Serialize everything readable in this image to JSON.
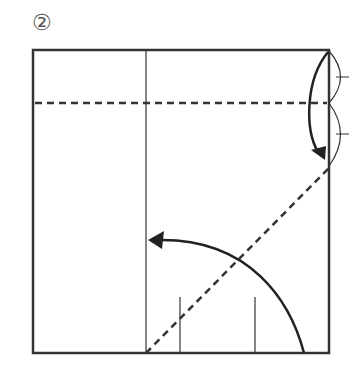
{
  "step": {
    "label": "②",
    "number": 2
  },
  "diagram": {
    "type": "origami-fold-step",
    "colors": {
      "line": "#333333",
      "background": "#ffffff"
    },
    "square": {
      "x": 33,
      "y": 50,
      "w": 296,
      "h": 303
    },
    "elements": [
      {
        "kind": "crease-line",
        "name": "vertical-crease"
      },
      {
        "kind": "valley-fold",
        "name": "horizontal-valley-fold"
      },
      {
        "kind": "valley-fold",
        "name": "diagonal-valley-fold"
      },
      {
        "kind": "arrow",
        "name": "fold-down-arrow"
      },
      {
        "kind": "arrow",
        "name": "fold-over-arrow"
      },
      {
        "kind": "equal-marks",
        "name": "equal-division-marks"
      },
      {
        "kind": "ticks",
        "name": "bottom-reference-ticks"
      }
    ]
  }
}
